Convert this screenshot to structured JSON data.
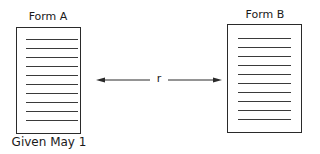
{
  "diagram": {
    "form_a": {
      "title": "Form A",
      "caption": "Given May 1",
      "line_count": 10
    },
    "form_b": {
      "title": "Form B",
      "line_count": 10
    },
    "connector": {
      "label": "r",
      "direction": "bidirectional"
    }
  }
}
